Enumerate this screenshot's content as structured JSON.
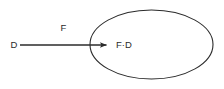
{
  "diagram": {
    "type": "arrow-to-ellipse-composition",
    "background_color": "#ffffff",
    "stroke_color": "#2b2b2b",
    "text_color": "#2b2b2b",
    "source": {
      "label": "D"
    },
    "edge": {
      "label": "F",
      "arrowhead": "filled-triangle"
    },
    "node": {
      "label": "F·D",
      "shape": "ellipse"
    }
  },
  "geometry": {
    "width": 224,
    "height": 89,
    "ellipse": {
      "cx": 151.5,
      "cy": 44.5,
      "rx": 61.5,
      "ry": 34.5
    },
    "arrow": {
      "x1": 20,
      "y1": 45,
      "x2": 108,
      "y2": 45
    },
    "source_label_pos": {
      "x": 14,
      "y": 45
    },
    "edge_label_pos": {
      "x": 63.5,
      "y": 28.5
    },
    "node_label_pos": {
      "x": 116,
      "y": 45
    }
  }
}
